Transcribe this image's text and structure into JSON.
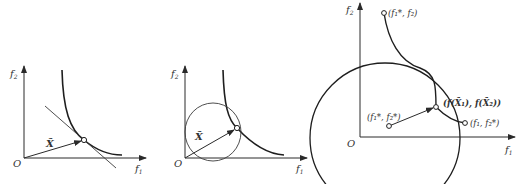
{
  "figure": {
    "panels": [
      {
        "id": "panel-1",
        "description": "Pareto front with tangent line at compromise point",
        "axes": {
          "x_label": "f",
          "x_sub": "1",
          "y_label": "f",
          "y_sub": "2",
          "origin_label": "O"
        },
        "vector_label": "X̃"
      },
      {
        "id": "panel-2",
        "description": "Pareto front with circle tangent at compromise point",
        "axes": {
          "x_label": "f",
          "x_sub": "1",
          "y_label": "f",
          "y_sub": "2",
          "origin_label": "O"
        },
        "vector_label": "X̃"
      },
      {
        "id": "panel-3",
        "description": "Pareto front between extreme points with ideal point and circle",
        "axes": {
          "x_label": "f",
          "x_sub": "1",
          "y_label": "f",
          "y_sub": "2",
          "origin_label": "O"
        },
        "points": {
          "top_point": "(f₁*, f₂)",
          "ideal_point": "(f₁*, f₂*)",
          "compromise_point": "(f(X̃₁), f(X̃₂))",
          "right_point": "(f₁, f₂*)"
        }
      }
    ],
    "colors": {
      "stroke": "#2a2a2a",
      "background": "#ffffff"
    }
  }
}
